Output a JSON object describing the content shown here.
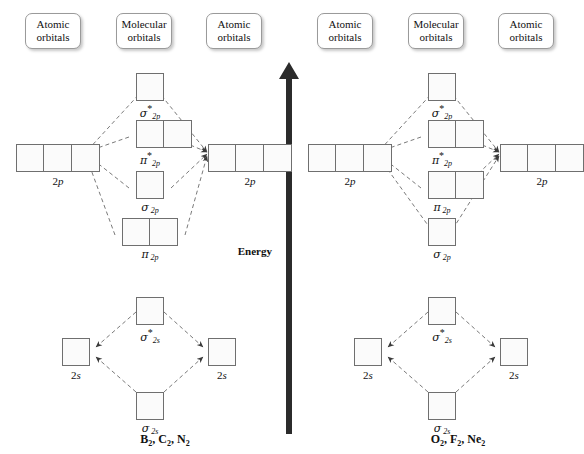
{
  "figure": {
    "type": "molecular-orbital-energy-diagram",
    "energy_axis_label": "Energy",
    "energy_axis_direction": "up"
  },
  "headers": {
    "atomic_left": {
      "line1": "Atomic",
      "line2": "orbitals"
    },
    "molecular": {
      "line1": "Molecular",
      "line2": "orbitals"
    },
    "atomic_right": {
      "line1": "Atomic",
      "line2": "orbitals"
    }
  },
  "diagrams": [
    {
      "id": "left",
      "molecules": "B2, C2, N2",
      "molecules_parts": [
        {
          "element": "B",
          "sub": "2"
        },
        {
          "element": "C",
          "sub": "2"
        },
        {
          "element": "N",
          "sub": "2"
        }
      ],
      "atomic_orbitals": [
        {
          "name": "2p",
          "symbol": "2",
          "italic": "p",
          "cells": 3,
          "side": "left",
          "level": "p"
        },
        {
          "name": "2p",
          "symbol": "2",
          "italic": "p",
          "cells": 3,
          "side": "right",
          "level": "p"
        },
        {
          "name": "2s",
          "symbol": "2",
          "italic": "s",
          "cells": 1,
          "side": "left",
          "level": "s"
        },
        {
          "name": "2s",
          "symbol": "2",
          "italic": "s",
          "cells": 1,
          "side": "right",
          "level": "s"
        }
      ],
      "molecular_orbitals": [
        {
          "id": "sigma2p_star",
          "greek": "σ",
          "star": true,
          "sub": "2p",
          "cells": 1,
          "order": 1
        },
        {
          "id": "pi2p_star",
          "greek": "π",
          "star": true,
          "sub": "2p",
          "cells": 2,
          "order": 2
        },
        {
          "id": "sigma2p",
          "greek": "σ",
          "star": false,
          "sub": "2p",
          "cells": 1,
          "order": 3
        },
        {
          "id": "pi2p",
          "greek": "π",
          "star": false,
          "sub": "2p",
          "cells": 2,
          "order": 4
        },
        {
          "id": "sigma2s_star",
          "greek": "σ",
          "star": true,
          "sub": "2s",
          "cells": 1,
          "order": 5
        },
        {
          "id": "sigma2s",
          "greek": "σ",
          "star": false,
          "sub": "2s",
          "cells": 1,
          "order": 6
        }
      ]
    },
    {
      "id": "right",
      "molecules": "O2, F2, Ne2",
      "molecules_parts": [
        {
          "element": "O",
          "sub": "2"
        },
        {
          "element": "F",
          "sub": "2"
        },
        {
          "element": "Ne",
          "sub": "2"
        }
      ],
      "atomic_orbitals": [
        {
          "name": "2p",
          "symbol": "2",
          "italic": "p",
          "cells": 3,
          "side": "left",
          "level": "p"
        },
        {
          "name": "2p",
          "symbol": "2",
          "italic": "p",
          "cells": 3,
          "side": "right",
          "level": "p"
        },
        {
          "name": "2s",
          "symbol": "2",
          "italic": "s",
          "cells": 1,
          "side": "left",
          "level": "s"
        },
        {
          "name": "2s",
          "symbol": "2",
          "italic": "s",
          "cells": 1,
          "side": "right",
          "level": "s"
        }
      ],
      "molecular_orbitals": [
        {
          "id": "sigma2p_star",
          "greek": "σ",
          "star": true,
          "sub": "2p",
          "cells": 1,
          "order": 1
        },
        {
          "id": "pi2p_star",
          "greek": "π",
          "star": true,
          "sub": "2p",
          "cells": 2,
          "order": 2
        },
        {
          "id": "pi2p",
          "greek": "π",
          "star": false,
          "sub": "2p",
          "cells": 2,
          "order": 3
        },
        {
          "id": "sigma2p",
          "greek": "σ",
          "star": false,
          "sub": "2p",
          "cells": 1,
          "order": 4
        },
        {
          "id": "sigma2s_star",
          "greek": "σ",
          "star": true,
          "sub": "2s",
          "cells": 1,
          "order": 5
        },
        {
          "id": "sigma2s",
          "greek": "σ",
          "star": false,
          "sub": "2s",
          "cells": 1,
          "order": 6
        }
      ]
    }
  ],
  "colors": {
    "background": "#ffffff",
    "box_border": "#6f6f6f",
    "box_fill": "#fbfbfb",
    "dashed_line": "#7a7a7a",
    "arrow_dark": "#2b2b2b",
    "text": "#111111",
    "header_border": "#9a9a9a"
  }
}
